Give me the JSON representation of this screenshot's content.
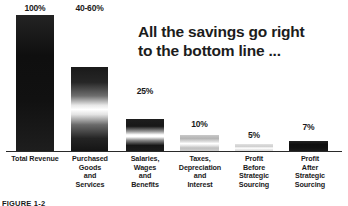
{
  "headline": {
    "line1": "All the savings go right",
    "line2": "to the bottom line ..."
  },
  "caption": "FIGURE 1-2",
  "colors": {
    "text": "#1a1a1a",
    "axis": "#2a2a2a",
    "bar_dark": "#151515",
    "background": "#ffffff"
  },
  "chart_data": {
    "type": "bar",
    "title": "All the savings go right to the bottom line ...",
    "xlabel": "",
    "ylabel": "",
    "ylim": [
      0,
      100
    ],
    "grid": false,
    "legend": null,
    "categories": [
      "Total Revenue",
      "Purchased Goods and Services",
      "Salaries, Wages and Benefits",
      "Taxes, Depreciation and Interest",
      "Profit Before Strategic Sourcing",
      "Profit After Strategic Sourcing"
    ],
    "values": [
      100,
      50,
      25,
      10,
      5,
      7
    ],
    "value_labels": [
      "100%",
      "40-60%",
      "25%",
      "10%",
      "5%",
      "7%"
    ],
    "bars": [
      {
        "label": "100%",
        "value": 100,
        "fill": "solid-dark",
        "left": 16,
        "width": 38,
        "height": 137,
        "label_top": 3
      },
      {
        "label": "40-60%",
        "value": 50,
        "fill": "grad",
        "left": 71,
        "width": 37,
        "height": 85,
        "label_top": 3
      },
      {
        "label": "25%",
        "value": 25,
        "fill": "grad-tight",
        "left": 126,
        "width": 38,
        "height": 33,
        "label_top": 86
      },
      {
        "label": "10%",
        "value": 10,
        "fill": "pale",
        "left": 180,
        "width": 39,
        "height": 17,
        "label_top": 119
      },
      {
        "label": "5%",
        "value": 5,
        "fill": "faint",
        "left": 235,
        "width": 38,
        "height": 8,
        "label_top": 130
      },
      {
        "label": "7%",
        "value": 7,
        "fill": "solid-dark",
        "left": 289,
        "width": 39,
        "height": 11,
        "label_top": 122
      }
    ],
    "category_lines": [
      [
        "Total Revenue"
      ],
      [
        "Purchased",
        "Goods",
        "and",
        "Services"
      ],
      [
        "Salaries,",
        "Wages",
        "and",
        "Benefits"
      ],
      [
        "Taxes,",
        "Depreciation",
        "and",
        "Interest"
      ],
      [
        "Profit",
        "Before",
        "Strategic",
        "Sourcing"
      ],
      [
        "Profit",
        "After",
        "Strategic",
        "Sourcing"
      ]
    ],
    "category_positions": [
      {
        "left": 2,
        "width": 66
      },
      {
        "left": 58,
        "width": 64
      },
      {
        "left": 113,
        "width": 64
      },
      {
        "left": 165,
        "width": 70
      },
      {
        "left": 222,
        "width": 64
      },
      {
        "left": 277,
        "width": 66
      }
    ]
  }
}
